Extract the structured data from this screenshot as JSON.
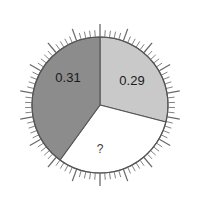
{
  "chart_data": {
    "type": "pie",
    "title": "",
    "subtitle": "",
    "xlabel": "",
    "ylabel": "",
    "grid": false,
    "legend_position": "none",
    "center_x": 100,
    "center_y": 105,
    "radius": 68,
    "start_angle_deg": 0,
    "direction": "clockwise",
    "tick_marks": {
      "visible": true,
      "minor_count": 90,
      "minor_length": 7,
      "major_every": 5,
      "major_length": 13,
      "color": "#6b6b6b",
      "position": "outside"
    },
    "categories": [
      "0.29",
      "?",
      "0.31"
    ],
    "labels": [
      "0.29",
      "?",
      "0.31"
    ],
    "values": [
      0.29,
      null,
      0.31
    ],
    "slices": [
      {
        "label": "0.29",
        "value": 0.29,
        "start_angle_deg": 0,
        "end_angle_deg": 104.4,
        "color": "#c9c9c9",
        "label_x": 132,
        "label_y": 82,
        "known": true
      },
      {
        "label": "?",
        "value": null,
        "start_angle_deg": 104.4,
        "end_angle_deg": 216.0,
        "color": "#ffffff",
        "label_x": 100,
        "label_y": 150,
        "known": false
      },
      {
        "label": "0.31",
        "value": 0.31,
        "start_angle_deg": 216.0,
        "end_angle_deg": 360,
        "color": "#8c8c8c",
        "label_x": 68,
        "label_y": 79,
        "known": true
      }
    ],
    "outline_color": "#555555",
    "background": "#ffffff"
  },
  "figure": {
    "background_color": "#ffffff",
    "outline_color": "#555555",
    "label_color": "#1a1a1a",
    "unknown_marker": "?"
  },
  "slice_left": {
    "label": "0.31"
  },
  "slice_right": {
    "label": "0.29"
  },
  "slice_bottom": {
    "label": "?"
  }
}
